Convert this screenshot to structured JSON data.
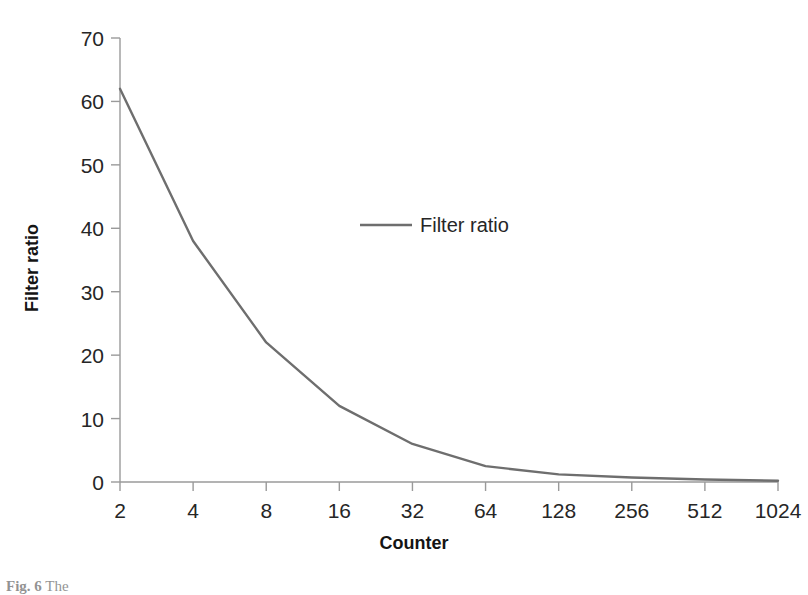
{
  "chart_data": {
    "type": "line",
    "title": "",
    "xlabel": "Counter",
    "ylabel": "Filter ratio",
    "categories": [
      "2",
      "4",
      "8",
      "16",
      "32",
      "64",
      "128",
      "256",
      "512",
      "1024"
    ],
    "series": [
      {
        "name": "Filter ratio",
        "color": "#6e6e6e",
        "values": [
          62,
          38,
          22,
          12,
          6,
          2.5,
          1.2,
          0.7,
          0.4,
          0.2
        ]
      }
    ],
    "ylim": [
      0,
      70
    ],
    "yticks": [
      0,
      10,
      20,
      30,
      40,
      50,
      60,
      70
    ],
    "ytick_labels": [
      "0",
      "10",
      "20",
      "30",
      "40",
      "50",
      "60",
      "70"
    ],
    "xtick_labels": [
      "2",
      "4",
      "8",
      "16",
      "32",
      "64",
      "128",
      "256",
      "512",
      "1024"
    ],
    "grid": false,
    "legend": {
      "position": "inside-top-center",
      "entries": [
        {
          "label": "Filter ratio",
          "color": "#6e6e6e"
        }
      ]
    },
    "axis_color": "#9a9a9a",
    "text_color": "#262626"
  },
  "caption": {
    "prefix": "Fig. 6",
    "text": "The"
  }
}
